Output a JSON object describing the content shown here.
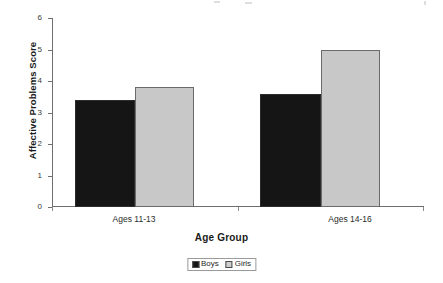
{
  "chart_data": {
    "type": "bar",
    "title": "",
    "xlabel": "Age Group",
    "ylabel": "Affective Problems Score",
    "categories": [
      "Ages 11-13",
      "Ages 14-16"
    ],
    "series": [
      {
        "name": "Boys",
        "color": "#151515",
        "values": [
          3.4,
          3.6
        ]
      },
      {
        "name": "Girls",
        "color": "#c8c8c8",
        "values": [
          3.8,
          5.0
        ]
      }
    ],
    "ylim": [
      0,
      6
    ],
    "yticks": [
      0,
      1,
      2,
      3,
      4,
      5,
      6
    ],
    "ytick_labels": [
      "0",
      "1",
      "2",
      "3",
      "4",
      "5",
      "6"
    ],
    "grid": false,
    "legend_position": "bottom-center",
    "legend_entries": [
      "Boys",
      "Girls"
    ]
  },
  "axes": {
    "y_title": "Affective Problems Score",
    "x_title": "Age Group",
    "y_ticks": [
      "6",
      "5",
      "4",
      "3",
      "2",
      "1",
      "0"
    ],
    "x_categories": [
      "Ages 11-13",
      "Ages 14-16"
    ]
  },
  "legend": {
    "items": [
      {
        "label": "Boys"
      },
      {
        "label": "Girls"
      }
    ]
  }
}
